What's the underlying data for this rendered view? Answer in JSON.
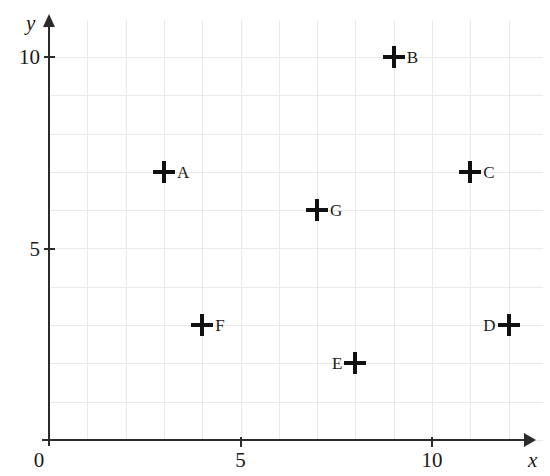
{
  "chart_data": {
    "type": "scatter",
    "title": "",
    "xlabel": "x",
    "ylabel": "y",
    "xlim": [
      0,
      12.9
    ],
    "ylim": [
      0,
      11
    ],
    "grid": true,
    "legend": "none",
    "marker": "plus-cross",
    "x_ticks": [
      {
        "value": 0,
        "label": "0"
      },
      {
        "value": 5,
        "label": "5"
      },
      {
        "value": 10,
        "label": "10"
      }
    ],
    "y_ticks": [
      {
        "value": 0,
        "label": "0"
      },
      {
        "value": 5,
        "label": "5"
      },
      {
        "value": 10,
        "label": "10"
      }
    ],
    "points": [
      {
        "label": "A",
        "x": 3,
        "y": 7,
        "label_side": "right"
      },
      {
        "label": "B",
        "x": 9,
        "y": 10,
        "label_side": "right"
      },
      {
        "label": "C",
        "x": 11,
        "y": 7,
        "label_side": "right"
      },
      {
        "label": "D",
        "x": 12,
        "y": 3,
        "label_side": "left"
      },
      {
        "label": "E",
        "x": 8,
        "y": 2,
        "label_side": "left"
      },
      {
        "label": "F",
        "x": 4,
        "y": 3,
        "label_side": "right"
      },
      {
        "label": "G",
        "x": 7,
        "y": 6,
        "label_side": "right"
      }
    ],
    "colors": {
      "axis": "#2b2b2b",
      "grid": "#e9e9e9",
      "marker": "#111111",
      "text": "#1a1a1a",
      "background": "#ffffff"
    }
  },
  "origin_label": "0"
}
